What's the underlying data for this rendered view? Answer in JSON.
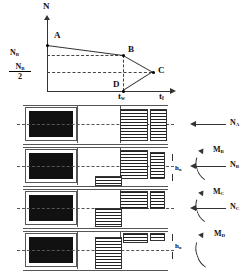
{
  "diagram": {
    "chart": {
      "y_axis_label": "N",
      "x_axis_labels": [
        "t",
        "t"
      ],
      "x_tick_sub": [
        "w",
        "f"
      ],
      "y_ticks": [
        {
          "label": "N",
          "sub": "B"
        },
        {
          "label_num": "N",
          "label_num_sub": "B",
          "label_den": "2"
        }
      ],
      "points": [
        {
          "name": "A",
          "x": 0,
          "y": 100
        },
        {
          "name": "B",
          "x": 62,
          "y": 78
        },
        {
          "name": "C",
          "x": 100,
          "y": 50
        },
        {
          "name": "D",
          "x": 62,
          "y": 0
        }
      ],
      "lines": [
        "A-B",
        "B-C",
        "C-D"
      ]
    },
    "panels": [
      {
        "id": "A",
        "force_label": "N",
        "force_sub": "A",
        "moment_label": null,
        "moment_sub": null,
        "dim_label": null,
        "dim_sub": null
      },
      {
        "id": "B",
        "force_label": "N",
        "force_sub": "B",
        "moment_label": "M",
        "moment_sub": "B",
        "dim_label": "h",
        "dim_sub": "n"
      },
      {
        "id": "C",
        "force_label": "N",
        "force_sub": "C",
        "moment_label": "M",
        "moment_sub": "C",
        "dim_label": null,
        "dim_sub": null
      },
      {
        "id": "D",
        "force_label": null,
        "force_sub": null,
        "moment_label": "M",
        "moment_sub": "D",
        "dim_label": "h",
        "dim_sub": "n"
      }
    ],
    "colors": {
      "ink": "#111111",
      "rule": "#555555",
      "fill": "#111111"
    }
  }
}
